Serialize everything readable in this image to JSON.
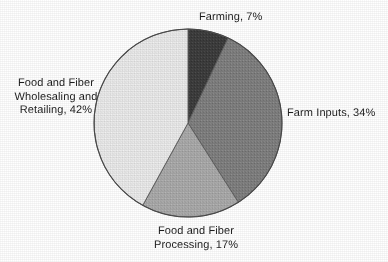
{
  "chart_data": {
    "type": "pie",
    "title": "",
    "subtitle": "",
    "xlabel": "",
    "ylabel": "",
    "legend_position": "none",
    "grid": false,
    "start_angle_deg": 0,
    "direction": "clockwise",
    "units": "percent",
    "categories": [
      "Farming",
      "Farm Inputs",
      "Food and Fiber Processing",
      "Food and Fiber Wholesaling and Retailing"
    ],
    "values": [
      7,
      34,
      17,
      42
    ],
    "colors": [
      "#3d3d3d",
      "#7f7f7f",
      "#a9a9a9",
      "#e9e9e9"
    ],
    "slices": [
      {
        "name": "Farming",
        "value": 7,
        "label": "Farming, 7%",
        "color": "#3d3d3d",
        "start_deg": 0,
        "end_deg": 25.2
      },
      {
        "name": "Farm Inputs",
        "value": 34,
        "label": "Farm Inputs, 34%",
        "color": "#7f7f7f",
        "start_deg": 25.2,
        "end_deg": 147.6
      },
      {
        "name": "Food and Fiber Processing",
        "value": 17,
        "label": "Food and Fiber\nProcessing, 17%",
        "color": "#a9a9a9",
        "start_deg": 147.6,
        "end_deg": 208.8
      },
      {
        "name": "Food and Fiber Wholesaling and Retailing",
        "value": 42,
        "label": "Food and Fiber\nWholesaling and\nRetailing, 42%",
        "color": "#e9e9e9",
        "start_deg": 208.8,
        "end_deg": 360
      }
    ]
  },
  "labels": {
    "farming": "Farming, 7%",
    "farm_inputs": "Farm Inputs, 34%",
    "wholesaling": "Food and Fiber\nWholesaling and\nRetailing, 42%",
    "processing": "Food and Fiber\nProcessing, 17%"
  },
  "style": {
    "background": "#ffffff",
    "outline": "#4a4a4a",
    "text_color": "#1d1d1d"
  }
}
